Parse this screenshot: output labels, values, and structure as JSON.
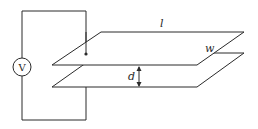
{
  "diagram": {
    "source": {
      "label": "V",
      "type": "voltage-source"
    },
    "labels": {
      "length": "l",
      "width": "w",
      "separation": "d"
    },
    "colors": {
      "line": "#2a2a2a",
      "background": "#ffffff"
    }
  }
}
